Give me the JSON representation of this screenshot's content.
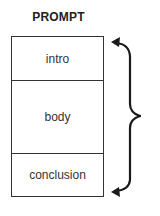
{
  "diagram": {
    "title": "PROMPT",
    "sections": [
      {
        "label": "intro"
      },
      {
        "label": "body"
      },
      {
        "label": "conclusion"
      }
    ],
    "connector": {
      "type": "curly-brace-with-arrows",
      "from": "intro",
      "to": "conclusion",
      "color": "#1a1a1a"
    }
  }
}
